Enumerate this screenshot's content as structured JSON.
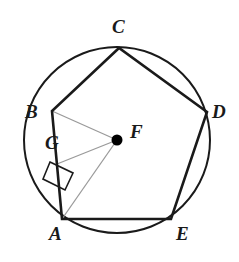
{
  "figure": {
    "type": "geometry-diagram",
    "canvas": {
      "width": 239,
      "height": 262
    },
    "colors": {
      "stroke_dark": "#1a1a1a",
      "stroke_light": "#9a9a9a",
      "background": "#ffffff",
      "point_fill": "#000000"
    },
    "circle": {
      "name": "circumscribed-circle",
      "center": {
        "x": 117,
        "y": 140
      },
      "radius": 93,
      "stroke_width": 2
    },
    "polygon": {
      "name": "regular-pentagon",
      "sides": 5,
      "stroke_width": 2.6,
      "vertices": [
        {
          "id": "A",
          "x": 62,
          "y": 219,
          "label_x": 49,
          "label_y": 224
        },
        {
          "id": "B",
          "x": 52,
          "y": 111,
          "label_x": 25,
          "label_y": 102
        },
        {
          "id": "C",
          "x": 119,
          "y": 48,
          "label_x": 112,
          "label_y": 17
        },
        {
          "id": "D",
          "x": 207,
          "y": 112,
          "label_x": 212,
          "label_y": 102
        },
        {
          "id": "E",
          "x": 171,
          "y": 219,
          "label_x": 176,
          "label_y": 224
        }
      ],
      "edges": [
        [
          "A",
          "B"
        ],
        [
          "B",
          "C"
        ],
        [
          "C",
          "D"
        ],
        [
          "D",
          "E"
        ],
        [
          "E",
          "A"
        ]
      ]
    },
    "center_point": {
      "id": "F",
      "name": "circle-center-F",
      "x": 117,
      "y": 140,
      "dot_radius": 5.5,
      "label_x": 130,
      "label_y": 122
    },
    "foot_point": {
      "id": "G",
      "name": "apothem-foot-G",
      "x": 57,
      "y": 164,
      "label_x": 45,
      "label_y": 133
    },
    "segments": [
      {
        "name": "radius-FB",
        "from": "F",
        "to": "B",
        "x1": 117,
        "y1": 140,
        "x2": 52,
        "y2": 111,
        "style": "light",
        "stroke_width": 1.3
      },
      {
        "name": "radius-FA",
        "from": "F",
        "to": "A",
        "x1": 117,
        "y1": 140,
        "x2": 62,
        "y2": 219,
        "style": "light",
        "stroke_width": 1.3
      },
      {
        "name": "apothem-FG",
        "from": "F",
        "to": "G",
        "x1": 117,
        "y1": 140,
        "x2": 57,
        "y2": 164,
        "style": "light",
        "stroke_width": 1.3
      }
    ],
    "right_angle_marker": {
      "name": "right-angle-marker-at-G",
      "at_point": "G",
      "angle_degrees": 90,
      "stroke_width": 1.6,
      "points": "50,162 73,173 65,190 43,179"
    },
    "labels": {
      "A": "A",
      "B": "B",
      "C": "C",
      "D": "D",
      "E": "E",
      "F": "F",
      "G": "G"
    }
  }
}
